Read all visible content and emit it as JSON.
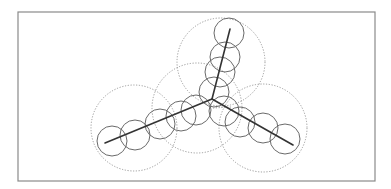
{
  "diagram": {
    "title": "",
    "frame": {
      "x": 18,
      "y": 12,
      "width": 357,
      "height": 169,
      "stroke": "#8a8a8a"
    },
    "colors": {
      "skeleton": "#333333",
      "small_circle": "#6a6a6a",
      "large_circle": "#9a9a9a",
      "background": "#ffffff"
    },
    "junction": {
      "x": 212,
      "y": 99
    },
    "arms": [
      {
        "name": "top",
        "end": {
          "x": 230,
          "y": 29
        }
      },
      {
        "name": "left",
        "end": {
          "x": 105,
          "y": 143
        }
      },
      {
        "name": "right",
        "end": {
          "x": 293,
          "y": 145
        }
      }
    ],
    "small_circles": [
      {
        "cx": 229,
        "cy": 33,
        "r": 15
      },
      {
        "cx": 225,
        "cy": 57,
        "r": 15
      },
      {
        "cx": 220,
        "cy": 72,
        "r": 15
      },
      {
        "cx": 214,
        "cy": 92,
        "r": 15
      },
      {
        "cx": 112,
        "cy": 141,
        "r": 15
      },
      {
        "cx": 135,
        "cy": 135,
        "r": 15
      },
      {
        "cx": 160,
        "cy": 124,
        "r": 15
      },
      {
        "cx": 181,
        "cy": 116,
        "r": 15
      },
      {
        "cx": 196,
        "cy": 110,
        "r": 15
      },
      {
        "cx": 224,
        "cy": 111,
        "r": 15
      },
      {
        "cx": 240,
        "cy": 122,
        "r": 15
      },
      {
        "cx": 263,
        "cy": 128,
        "r": 15
      },
      {
        "cx": 285,
        "cy": 139,
        "r": 15
      }
    ],
    "large_circles": [
      {
        "cx": 221,
        "cy": 62,
        "r": 44
      },
      {
        "cx": 134,
        "cy": 128,
        "r": 43
      },
      {
        "cx": 197,
        "cy": 108,
        "r": 45
      },
      {
        "cx": 263,
        "cy": 128,
        "r": 44
      }
    ],
    "dotted_segments": [
      {
        "x1": 213,
        "y1": 108,
        "x2": 231,
        "y2": 107
      }
    ]
  }
}
